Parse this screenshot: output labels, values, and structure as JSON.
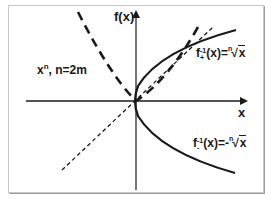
{
  "diagram": {
    "y_axis_label": "f(x)",
    "x_axis_label": "x",
    "function_label": {
      "base": "x",
      "exponent": "n",
      "condition": ", n=2m"
    },
    "inverse_positive_label": {
      "func": "f",
      "sup": "-1",
      "sub": "+",
      "arg": "(x)=",
      "root_index": "n",
      "radicand": "x"
    },
    "inverse_negative_label": {
      "func": "f",
      "sup": "-1",
      "sub": "-",
      "arg": "(x)=-",
      "root_index": "n",
      "radicand": "x"
    },
    "colors": {
      "stroke": "#1a1a1a",
      "frame": "#c8c8c8",
      "background": "#ffffff"
    },
    "curves": [
      {
        "name": "y=x",
        "style": "thin dashed"
      },
      {
        "name": "x^n, n=2m",
        "style": "thick dashed"
      },
      {
        "name": "f+^-1(x)=nth-root(x)",
        "style": "solid"
      },
      {
        "name": "f-^-1(x)=-nth-root(x)",
        "style": "solid"
      }
    ]
  }
}
